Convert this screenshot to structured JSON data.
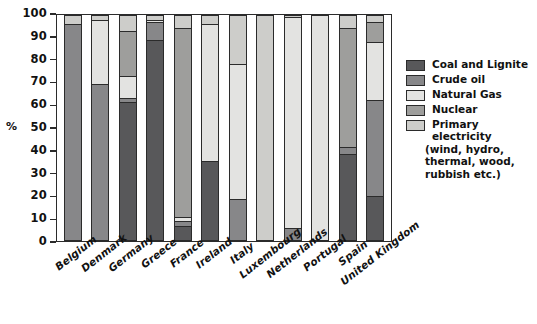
{
  "chart_data": {
    "type": "bar",
    "title": "",
    "xlabel": "",
    "ylabel": "%",
    "ylim": [
      0,
      100
    ],
    "yticks": [
      0,
      10,
      20,
      30,
      40,
      50,
      60,
      70,
      80,
      90,
      100
    ],
    "ytick_labels": [
      "0",
      "10",
      "20",
      "30",
      "40",
      "50",
      "60",
      "70",
      "80",
      "90",
      "100"
    ],
    "grid": false,
    "stacked": true,
    "legend_position": "right",
    "categories": [
      "Belgium",
      "Denmark",
      "Germany",
      "Greece",
      "France",
      "Ireland",
      "Italy",
      "Luxembourg",
      "Netherlands",
      "Portugal",
      "Spain",
      "United Kingdom"
    ],
    "series": [
      {
        "name": "Coal and Lignite",
        "color": "#58585a",
        "values": [
          0,
          0,
          61,
          89,
          6,
          35,
          0,
          0,
          0,
          0,
          38,
          19
        ]
      },
      {
        "name": "Crude oil",
        "color": "#878789",
        "values": [
          96,
          69,
          2,
          8,
          2,
          0,
          18,
          0,
          5,
          0,
          3,
          43
        ]
      },
      {
        "name": "Natural Gas",
        "color": "#e3e3e1",
        "values": [
          0,
          29,
          10,
          1,
          2,
          61,
          60,
          0,
          94,
          100,
          0,
          26
        ]
      },
      {
        "name": "Nuclear",
        "color": "#9e9e9c",
        "values": [
          0,
          0,
          20,
          0,
          84,
          0,
          0,
          0,
          0,
          0,
          53,
          9
        ]
      },
      {
        "name": "Primary electricity (wind, hydro, thermal, wood, rubbish etc.)",
        "color": "#cdcdca",
        "values": [
          4,
          2,
          7,
          2,
          6,
          4,
          22,
          100,
          1,
          0,
          6,
          3
        ]
      }
    ]
  },
  "legend": {
    "entries": [
      {
        "label": "Coal and Lignite",
        "sub": "",
        "color": "#58585a"
      },
      {
        "label": "Crude oil",
        "sub": "",
        "color": "#878789"
      },
      {
        "label": "Natural Gas",
        "sub": "",
        "color": "#e3e3e1"
      },
      {
        "label": "Nuclear",
        "sub": "",
        "color": "#9e9e9c"
      },
      {
        "label": "Primary electricity",
        "sub": "(wind, hydro,\nthermal, wood,\nrubbish etc.)",
        "color": "#cdcdca"
      }
    ]
  },
  "axis": {
    "unit_label": "%"
  }
}
